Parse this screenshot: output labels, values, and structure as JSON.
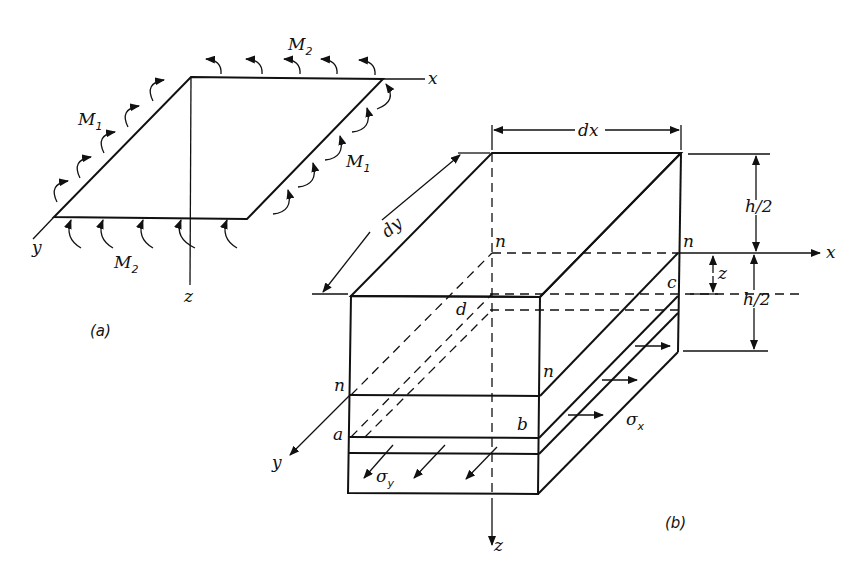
{
  "figure_a": {
    "caption": "(a)",
    "axes": {
      "x": "x",
      "y": "y",
      "z": "z"
    },
    "moments": [
      {
        "label": "M",
        "subscript": "2",
        "position": "top-edge"
      },
      {
        "label": "M",
        "subscript": "1",
        "position": "left-edge"
      },
      {
        "label": "M",
        "subscript": "1",
        "position": "right-edge"
      },
      {
        "label": "M",
        "subscript": "2",
        "position": "bottom-edge"
      }
    ]
  },
  "figure_b": {
    "caption": "(b)",
    "axes": {
      "x": "x",
      "y": "y",
      "z": "z"
    },
    "dimensions": {
      "dx": "dx",
      "dy": "dy",
      "h_top": "h/2",
      "h_bottom": "h/2",
      "z": "z"
    },
    "points": {
      "n1": "n",
      "n2": "n",
      "n3": "n",
      "n4": "n",
      "a": "a",
      "b": "b",
      "c": "c",
      "d": "d"
    },
    "stresses": {
      "sigma_x": "σ",
      "sigma_x_sub": "x",
      "sigma_y": "σ",
      "sigma_y_sub": "y"
    }
  }
}
